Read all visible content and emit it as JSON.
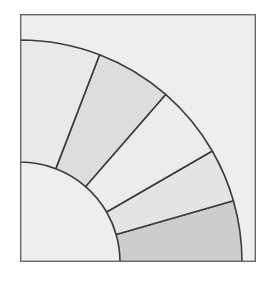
{
  "chart_data": {
    "type": "pie",
    "variant": "quarter-donut-ring",
    "title": "",
    "xlabel": "",
    "ylabel": "",
    "grid": false,
    "legend": false,
    "background_color": "#eeeeee",
    "border_color": "#666666",
    "segment_outline_color": "#3c3c3c",
    "geometry": {
      "center_x": 0,
      "center_y": 248,
      "inner_radius": 100,
      "outer_radius": 222,
      "start_angle_deg": 0,
      "end_angle_deg": 90,
      "angle_direction": "counterclockwise-from-east"
    },
    "categories": [
      "Segment 1",
      "Segment 2",
      "Segment 3",
      "Segment 4",
      "Segment 5"
    ],
    "values": [
      16,
      14,
      19,
      20,
      21
    ],
    "units": "degrees",
    "boundaries_deg": [
      0,
      16,
      30,
      49,
      69,
      90
    ],
    "slice_colors": [
      "#cdcdcd",
      "#e4e4e4",
      "#ececec",
      "#dddddd",
      "#e9e9e9"
    ]
  },
  "canvas": {
    "width": 275,
    "height": 284
  }
}
